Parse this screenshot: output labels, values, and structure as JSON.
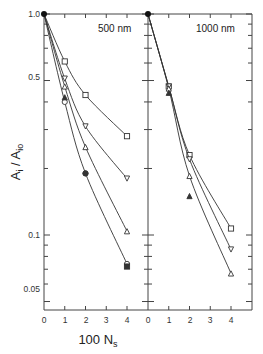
{
  "chart_data": {
    "type": "line",
    "yscale": "log",
    "ylabel": "A_i / A_io",
    "xlabel": "100 N_s",
    "ylim": [
      0.042,
      1.0
    ],
    "y_ticks_labeled": [
      1.0,
      0.5,
      0.1,
      0.05
    ],
    "x_ticks": [
      0,
      1,
      2,
      3,
      4
    ],
    "grid": false,
    "panels": [
      {
        "label": "500 nm",
        "x": [
          0,
          1,
          2,
          4
        ],
        "series": [
          {
            "name": "open-square",
            "marker": "square-open",
            "x": [
              0,
              1,
              2,
              4
            ],
            "values": [
              1.0,
              0.61,
              0.43,
              0.28
            ]
          },
          {
            "name": "open-down-triangle",
            "marker": "triangle-down-open",
            "x": [
              0,
              1,
              2,
              4
            ],
            "values": [
              1.0,
              0.51,
              0.31,
              0.18
            ]
          },
          {
            "name": "open-up-triangle",
            "marker": "triangle-up-open",
            "x": [
              0,
              1,
              2,
              4
            ],
            "values": [
              1.0,
              0.47,
              0.25,
              0.104
            ]
          },
          {
            "name": "open-circle",
            "marker": "circle-open",
            "x": [
              0,
              1,
              2,
              4
            ],
            "values": [
              1.0,
              0.4,
              0.19,
              0.074
            ]
          },
          {
            "name": "filled-points",
            "marker": "filled",
            "x": [
              1,
              2,
              4
            ],
            "values": [
              0.42,
              0.19,
              0.072
            ]
          }
        ]
      },
      {
        "label": "1000 nm",
        "x": [
          0,
          1,
          2,
          4
        ],
        "series": [
          {
            "name": "open-square",
            "marker": "square-open",
            "x": [
              0,
              1,
              2,
              4
            ],
            "values": [
              1.0,
              0.47,
              0.23,
              0.107
            ]
          },
          {
            "name": "open-down-triangle",
            "marker": "triangle-down-open",
            "x": [
              0,
              1,
              2,
              4
            ],
            "values": [
              1.0,
              0.47,
              0.22,
              0.086
            ]
          },
          {
            "name": "open-up-triangle",
            "marker": "triangle-up-open",
            "x": [
              0,
              1,
              2,
              4
            ],
            "values": [
              1.0,
              0.46,
              0.185,
              0.067
            ]
          },
          {
            "name": "filled-triangle",
            "marker": "triangle-up-filled",
            "x": [
              1,
              2
            ],
            "values": [
              0.44,
              0.15
            ]
          }
        ]
      }
    ]
  },
  "labels": {
    "ylabel_main": "A",
    "ylabel_sub_i": "i",
    "ylabel_slash": " / A",
    "ylabel_sub_io": "io",
    "xlabel_main": "100 N",
    "xlabel_sub": "s",
    "panel_left": "500 nm",
    "panel_right": "1000 nm",
    "ytick_1": "1.0",
    "ytick_05": "0.5",
    "ytick_01": "0.1",
    "ytick_005": "0.05",
    "xticks_left": [
      "0",
      "1",
      "2",
      "3",
      "4"
    ],
    "xticks_right": [
      "0",
      "1",
      "2",
      "3",
      "4"
    ]
  },
  "colors": {
    "line": "#333333",
    "axis": "#444444",
    "background": "#ffffff"
  }
}
